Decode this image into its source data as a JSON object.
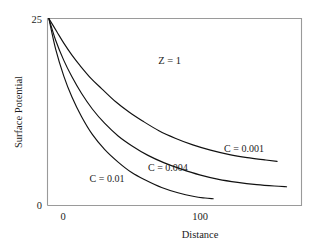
{
  "chart_data": {
    "type": "line",
    "title": "",
    "xlabel": "Distance",
    "ylabel": "Surface Potential",
    "xlim": [
      -12,
      175
    ],
    "ylim": [
      0,
      25
    ],
    "xticks": [
      0,
      100
    ],
    "xtick_labels": [
      "0",
      "100"
    ],
    "yticks": [
      0,
      25
    ],
    "ytick_labels": [
      "0",
      "25"
    ],
    "grid": false,
    "legend": "inline-curve-labels",
    "annotations": [
      {
        "text": "Z = 1",
        "x": 78,
        "y": 19.3
      }
    ],
    "series": [
      {
        "name": "C = 0.001",
        "label": "C = 0.001",
        "label_x": 118,
        "label_y": 7.5,
        "x": [
          -11,
          -5,
          0,
          6,
          12,
          20,
          28,
          38,
          48,
          58,
          70,
          82,
          95,
          108,
          122,
          135,
          148,
          157
        ],
        "y": [
          25.0,
          23.2,
          21.7,
          20.1,
          18.7,
          17.0,
          15.6,
          13.9,
          12.5,
          11.3,
          10.0,
          9.0,
          8.1,
          7.4,
          6.8,
          6.4,
          6.1,
          5.9
        ]
      },
      {
        "name": "C = 0.004",
        "label": "C = 0.004",
        "label_x": 62,
        "label_y": 5.0,
        "x": [
          -11,
          -6,
          0,
          6,
          13,
          21,
          30,
          40,
          50,
          62,
          74,
          86,
          100,
          114,
          128,
          142,
          155,
          164
        ],
        "y": [
          25.0,
          22.1,
          19.4,
          17.2,
          15.0,
          12.9,
          11.0,
          9.3,
          8.0,
          6.7,
          5.7,
          4.9,
          4.1,
          3.5,
          3.1,
          2.8,
          2.6,
          2.5
        ]
      },
      {
        "name": "C = 0.01",
        "label": "C = 0.01",
        "label_x": 19,
        "label_y": 3.6,
        "x": [
          -11,
          -6,
          0,
          6,
          13,
          21,
          30,
          40,
          50,
          60,
          72,
          84,
          96,
          104,
          110
        ],
        "y": [
          25.0,
          20.9,
          17.3,
          14.5,
          11.9,
          9.5,
          7.5,
          5.8,
          4.4,
          3.4,
          2.4,
          1.7,
          1.2,
          1.0,
          0.9
        ]
      }
    ]
  },
  "colors": {
    "curve": "#111111",
    "axis": "#9a9a9a",
    "text": "#1c1c1c",
    "background": "#ffffff"
  }
}
